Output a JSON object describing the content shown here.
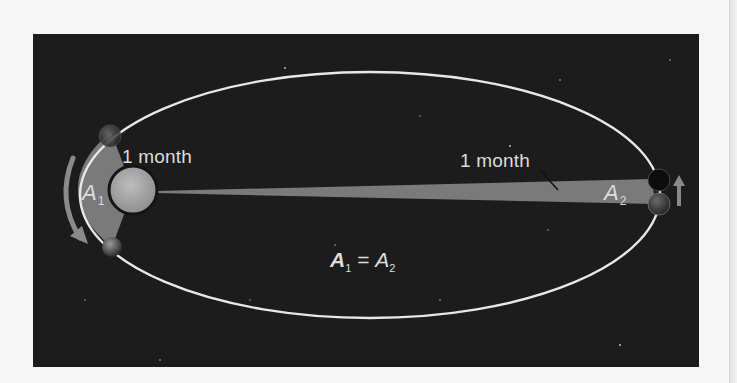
{
  "figure": {
    "labels": {
      "left_interval": "1 month",
      "right_interval": "1 month",
      "area_left": {
        "symbol": "A",
        "subscript": "1"
      },
      "area_right": {
        "symbol": "A",
        "subscript": "2"
      },
      "equation": {
        "lhs": "A",
        "lhs_sub": "1",
        "op": "=",
        "rhs": "A",
        "rhs_sub": "2"
      }
    },
    "elements": {
      "orbit": "elliptical-orbit",
      "sun": "sun-at-focus",
      "planet_positions": [
        "perihelion-start",
        "perihelion-end",
        "aphelion-start",
        "aphelion-end"
      ],
      "arrows": [
        "orbit-direction-arrow-perihelion",
        "orbit-direction-arrow-aphelion"
      ]
    },
    "colors": {
      "background": "#1c1c1c",
      "orbit": "#e8e8e8",
      "swept_area": "#7a7a7a",
      "sun": "#a8a8a8",
      "text": "#dcdcdc",
      "arrow": "#8a8a8a"
    }
  }
}
